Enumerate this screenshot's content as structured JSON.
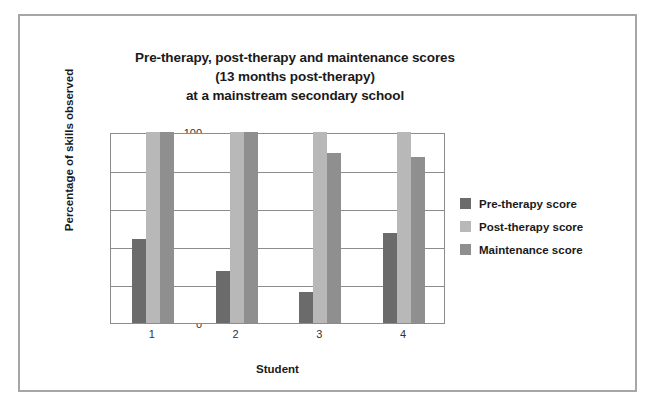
{
  "figure": {
    "border_color": "#a6a6a6",
    "background": "#ffffff"
  },
  "chart_data": {
    "type": "bar",
    "title": "Pre-therapy, post-therapy and maintenance scores (13 months post-therapy) at a mainstream secondary school",
    "title_lines": [
      "Pre-therapy, post-therapy and maintenance scores",
      "(13 months post-therapy)",
      "at a mainstream secondary school"
    ],
    "xlabel": "Student",
    "ylabel": "Percentage of skills observed",
    "categories": [
      "1",
      "2",
      "3",
      "4"
    ],
    "ylim": [
      0,
      100
    ],
    "yticks": [
      0,
      20,
      40,
      60,
      80,
      100
    ],
    "ytick_labels": [
      "0",
      "20",
      "40",
      "60",
      "80",
      "100"
    ],
    "grid": true,
    "legend_position": "right",
    "series": [
      {
        "name": "Pre-therapy score",
        "color": "#6b6b6b",
        "values": [
          44,
          27,
          16,
          47
        ]
      },
      {
        "name": "Post-therapy score",
        "color": "#b8b8b8",
        "values": [
          100,
          100,
          100,
          100
        ]
      },
      {
        "name": "Maintenance score",
        "color": "#8f8f8f",
        "values": [
          100,
          100,
          89,
          87
        ]
      }
    ]
  }
}
